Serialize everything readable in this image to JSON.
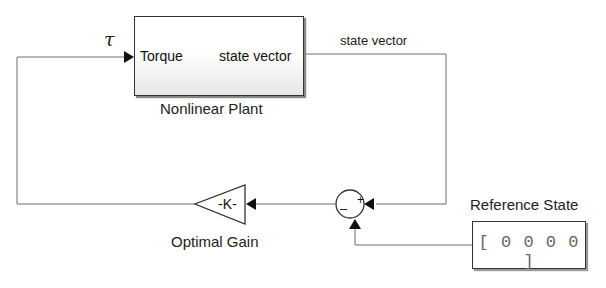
{
  "diagram": {
    "plant": {
      "name": "Nonlinear Plant",
      "input_port": "Torque",
      "output_port": "state vector"
    },
    "signals": {
      "input_symbol": "τ",
      "output_label": "state vector"
    },
    "gain": {
      "name": "Optimal Gain",
      "value": "-K-"
    },
    "sum": {
      "plus_sign": "+",
      "minus_sign": "–"
    },
    "reference": {
      "name": "Reference State",
      "value": "[ 0  0  0  0 ]"
    },
    "colors": {
      "line": "#6e6e6e",
      "block_border": "#333333",
      "arrow": "#111111"
    }
  }
}
